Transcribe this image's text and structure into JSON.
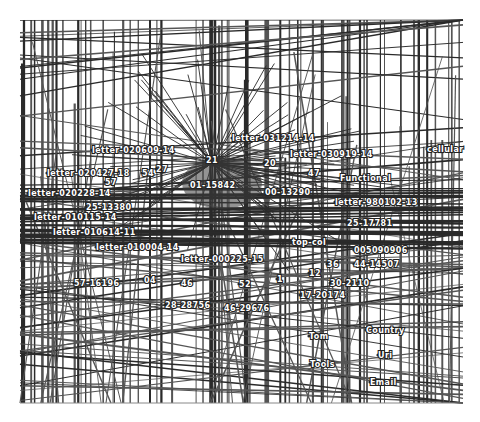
{
  "diagram": {
    "type": "network-graph",
    "canvas": {
      "x": 20,
      "y": 20,
      "width": 443,
      "height": 383
    },
    "colors": {
      "background": "#ffffff",
      "edge": "#2a2a2a",
      "edge_light": "#555555",
      "label_fill": "#ffffff",
      "label_stroke": "#222222"
    },
    "hub": {
      "x": 212,
      "y": 163,
      "label": "21"
    },
    "nodes": [
      {
        "id": "n1",
        "label": "letter-020609-14",
        "x": 92,
        "y": 153
      },
      {
        "id": "n2",
        "label": "letter-031214-14",
        "x": 232,
        "y": 141
      },
      {
        "id": "n3",
        "label": "letter-030919-14",
        "x": 290,
        "y": 157
      },
      {
        "id": "n4",
        "label": "cellular",
        "x": 427,
        "y": 152
      },
      {
        "id": "n5",
        "label": "21",
        "x": 206,
        "y": 163
      },
      {
        "id": "n6",
        "label": "20",
        "x": 264,
        "y": 166
      },
      {
        "id": "n7",
        "label": "47",
        "x": 308,
        "y": 176
      },
      {
        "id": "n8",
        "label": "letter-020427-18",
        "x": 47,
        "y": 176
      },
      {
        "id": "n9",
        "label": "54",
        "x": 142,
        "y": 176
      },
      {
        "id": "n10",
        "label": "27",
        "x": 156,
        "y": 172
      },
      {
        "id": "n11",
        "label": "57",
        "x": 105,
        "y": 185
      },
      {
        "id": "n12",
        "label": "01-15842",
        "x": 190,
        "y": 188
      },
      {
        "id": "n13",
        "label": "Functional",
        "x": 340,
        "y": 181
      },
      {
        "id": "n14",
        "label": "00-13290",
        "x": 265,
        "y": 195
      },
      {
        "id": "n15",
        "label": "letter-020228-14",
        "x": 28,
        "y": 196
      },
      {
        "id": "n16",
        "label": "letter-980102-13",
        "x": 335,
        "y": 205
      },
      {
        "id": "n17",
        "label": "25-13380",
        "x": 86,
        "y": 210
      },
      {
        "id": "n18",
        "label": "letter-010115-14",
        "x": 34,
        "y": 220
      },
      {
        "id": "n19",
        "label": "25-17781",
        "x": 347,
        "y": 226
      },
      {
        "id": "n20",
        "label": "letter-010614-11",
        "x": 53,
        "y": 235
      },
      {
        "id": "n21",
        "label": "top-col",
        "x": 292,
        "y": 245
      },
      {
        "id": "n22",
        "label": "letter-010004-14",
        "x": 96,
        "y": 250
      },
      {
        "id": "n23",
        "label": "005090906",
        "x": 354,
        "y": 253
      },
      {
        "id": "n24",
        "label": "letter-000225-15",
        "x": 181,
        "y": 262
      },
      {
        "id": "n25",
        "label": "36",
        "x": 327,
        "y": 267
      },
      {
        "id": "n26",
        "label": "44-14507",
        "x": 354,
        "y": 267
      },
      {
        "id": "n27",
        "label": "12",
        "x": 309,
        "y": 276
      },
      {
        "id": "n28",
        "label": "57-16196",
        "x": 74,
        "y": 286
      },
      {
        "id": "n29",
        "label": "04",
        "x": 144,
        "y": 283
      },
      {
        "id": "n30",
        "label": "46",
        "x": 181,
        "y": 286
      },
      {
        "id": "n31",
        "label": "52",
        "x": 239,
        "y": 287
      },
      {
        "id": "n32",
        "label": "1",
        "x": 277,
        "y": 282
      },
      {
        "id": "n33",
        "label": "30-2110",
        "x": 330,
        "y": 286
      },
      {
        "id": "n34",
        "label": "17-20174",
        "x": 300,
        "y": 298
      },
      {
        "id": "n35",
        "label": "28-28756",
        "x": 165,
        "y": 308
      },
      {
        "id": "n36",
        "label": "46-29676",
        "x": 224,
        "y": 311
      },
      {
        "id": "n37",
        "label": "Country",
        "x": 366,
        "y": 333
      },
      {
        "id": "n38",
        "label": "Tom",
        "x": 309,
        "y": 339
      },
      {
        "id": "n39",
        "label": "Uri",
        "x": 378,
        "y": 358
      },
      {
        "id": "n40",
        "label": "Tools",
        "x": 310,
        "y": 367
      },
      {
        "id": "n41",
        "label": "Email",
        "x": 370,
        "y": 385
      }
    ]
  }
}
